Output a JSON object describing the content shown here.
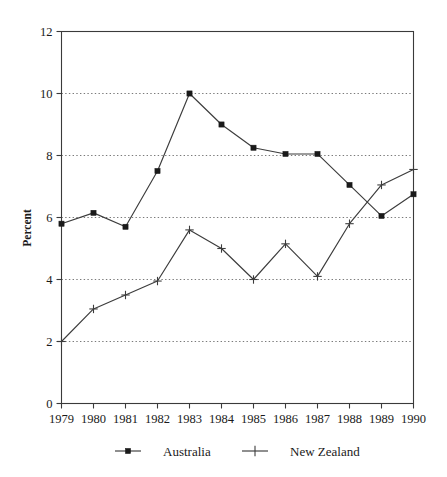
{
  "chart_data": {
    "type": "line",
    "title": "",
    "xlabel": "",
    "ylabel": "Percent",
    "categories": [
      "1979",
      "1980",
      "1981",
      "1982",
      "1983",
      "1984",
      "1985",
      "1986",
      "1987",
      "1988",
      "1989",
      "1990"
    ],
    "x": [
      1979,
      1980,
      1981,
      1982,
      1983,
      1984,
      1985,
      1986,
      1987,
      1988,
      1989,
      1990
    ],
    "series": [
      {
        "name": "Australia",
        "marker": "square",
        "values": [
          5.8,
          6.15,
          5.7,
          7.5,
          10.0,
          9.0,
          8.25,
          8.05,
          8.05,
          7.05,
          6.05,
          6.75
        ]
      },
      {
        "name": "New Zealand",
        "marker": "plus",
        "values": [
          2.0,
          3.05,
          3.5,
          3.95,
          5.6,
          5.0,
          4.0,
          5.15,
          4.1,
          5.8,
          7.05,
          7.55
        ]
      }
    ],
    "ylim": [
      0,
      12
    ],
    "yticks": [
      0,
      2,
      4,
      6,
      8,
      10,
      12
    ],
    "ytick_labels": [
      "0",
      "2",
      "4",
      "6",
      "8",
      "10",
      "12"
    ],
    "gridlines_y": [
      2,
      4,
      6,
      8,
      10
    ],
    "grid": true,
    "grid_style": "dotted-horizontal",
    "legend_position": "bottom-center",
    "legend": [
      "Australia",
      "New Zealand"
    ],
    "colors": {
      "axis": "#3a3a3a",
      "grid": "#6b6b6b",
      "series_australia": "#1a1a1a",
      "series_new_zealand": "#3c3c3c",
      "background": "#ffffff"
    }
  },
  "axes": {
    "y_title": "Percent"
  },
  "legend": {
    "items": [
      {
        "label": "Australia",
        "marker": "square-marker"
      },
      {
        "label": "New Zealand",
        "marker": "plus-marker"
      }
    ]
  }
}
